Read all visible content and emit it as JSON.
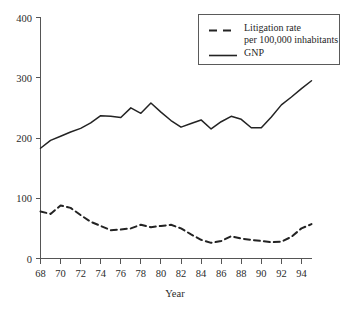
{
  "chart_data": {
    "type": "line",
    "title": "",
    "xlabel": "Year",
    "ylabel": "",
    "xlim": [
      68,
      95
    ],
    "ylim": [
      0,
      400
    ],
    "grid": false,
    "legend_position": "top-right",
    "x": [
      68,
      69,
      70,
      71,
      72,
      73,
      74,
      75,
      76,
      77,
      78,
      79,
      80,
      81,
      82,
      83,
      84,
      85,
      86,
      87,
      88,
      89,
      90,
      91,
      92,
      93,
      94,
      95
    ],
    "xtick_labels": [
      "68",
      "70",
      "72",
      "74",
      "76",
      "78",
      "80",
      "82",
      "84",
      "86",
      "88",
      "90",
      "92",
      "94"
    ],
    "xtick_values": [
      68,
      70,
      72,
      74,
      76,
      78,
      80,
      82,
      84,
      86,
      88,
      90,
      92,
      94
    ],
    "ytick_labels": [
      "0",
      "100",
      "200",
      "300",
      "400"
    ],
    "ytick_values": [
      0,
      100,
      200,
      300,
      400
    ],
    "series": [
      {
        "name": "Litigation rate per 100,000 inhabitants",
        "style": "dashed",
        "color": "#232323",
        "values": [
          78,
          74,
          88,
          84,
          72,
          61,
          54,
          47,
          48,
          50,
          56,
          52,
          54,
          56,
          50,
          40,
          31,
          26,
          29,
          37,
          33,
          31,
          29,
          27,
          28,
          36,
          50,
          57
        ]
      },
      {
        "name": "GNP",
        "style": "solid",
        "color": "#232323",
        "values": [
          183,
          196,
          203,
          210,
          216,
          225,
          237,
          236,
          234,
          250,
          241,
          258,
          243,
          229,
          218,
          224,
          230,
          215,
          227,
          236,
          231,
          217,
          217,
          235,
          255,
          268,
          282,
          295
        ]
      }
    ]
  },
  "legend": {
    "items": [
      {
        "line1": "Litigation rate",
        "line2": "per 100,000 inhabitants",
        "style": "dashed"
      },
      {
        "line1": "GNP",
        "line2": "",
        "style": "solid"
      }
    ]
  },
  "axis": {
    "x_title": "Year"
  }
}
